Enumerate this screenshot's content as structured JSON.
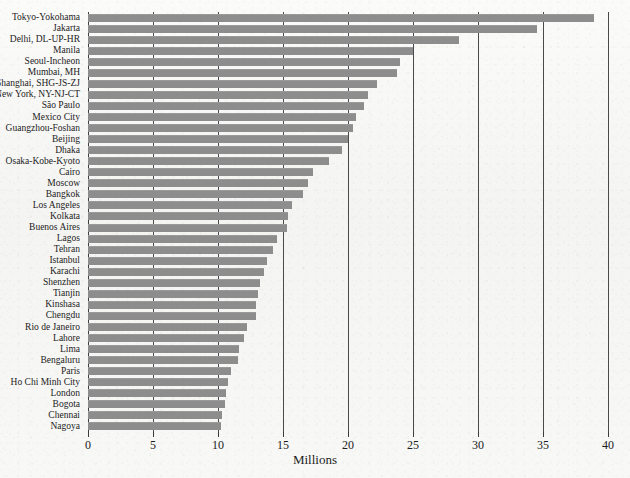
{
  "chart_data": {
    "type": "bar",
    "orientation": "horizontal",
    "title": "",
    "xlabel": "Millions",
    "ylabel": "",
    "xlim": [
      0,
      40
    ],
    "xticks": [
      0,
      5,
      10,
      15,
      20,
      25,
      30,
      35,
      40
    ],
    "grid": true,
    "legend": null,
    "bar_color": "#8d8d8d",
    "categories": [
      "Tokyo-Yokohama",
      "Jakarta",
      "Delhi, DL-UP-HR",
      "Manila",
      "Seoul-Incheon",
      "Mumbai, MH",
      "Shanghai, SHG-JS-ZJ",
      "New York, NY-NJ-CT",
      "São Paulo",
      "Mexico City",
      "Guangzhou-Foshan",
      "Beijing",
      "Dhaka",
      "Osaka-Kobe-Kyoto",
      "Cairo",
      "Moscow",
      "Bangkok",
      "Los Angeles",
      "Kolkata",
      "Buenos Aires",
      "Lagos",
      "Tehran",
      "Istanbul",
      "Karachi",
      "Shenzhen",
      "Tianjin",
      "Kinshasa",
      "Chengdu",
      "Rio de Janeiro",
      "Lahore",
      "Lima",
      "Bengaluru",
      "Paris",
      "Ho Chi Minh City",
      "London",
      "Bogota",
      "Chennai",
      "Nagoya"
    ],
    "values": [
      38.9,
      34.5,
      28.5,
      25.0,
      24.0,
      23.8,
      22.2,
      21.5,
      21.2,
      20.6,
      20.4,
      20.0,
      19.5,
      18.5,
      17.3,
      16.9,
      16.5,
      15.7,
      15.4,
      15.3,
      14.5,
      14.2,
      13.8,
      13.5,
      13.2,
      13.1,
      12.9,
      12.9,
      12.2,
      12.0,
      11.6,
      11.5,
      11.0,
      10.8,
      10.6,
      10.5,
      10.3,
      10.2
    ]
  }
}
